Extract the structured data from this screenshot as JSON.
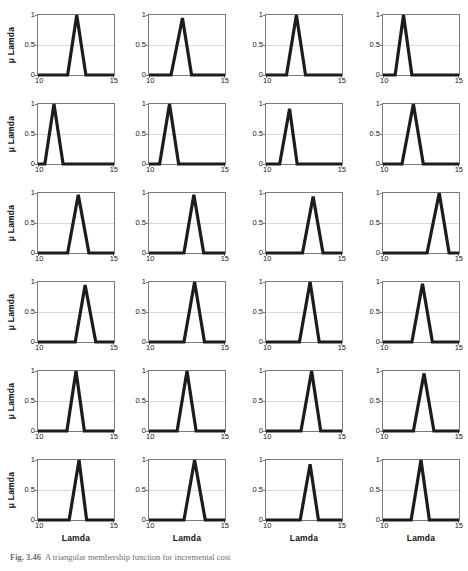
{
  "figure": {
    "caption_label": "Fig. 3.46",
    "caption_text": "A triangular membership function for incremental cost",
    "axis": {
      "xlabel": "Lamda",
      "ylabel": "μ Lamda",
      "xticks": [
        "10",
        "15"
      ],
      "yticks": [
        "1",
        "0.5",
        "0"
      ],
      "xlim": [
        10,
        15
      ],
      "ylim": [
        0,
        1
      ],
      "gridline_y": 0.5
    },
    "colors": {
      "curve": "#1c1c1c",
      "axis": "#7a7a7a",
      "gridline": "#d9d9d9",
      "background": "#ffffff",
      "caption": "#6f6f6f"
    },
    "rows": 6,
    "cols": 4
  },
  "chart_data": {
    "type": "line",
    "title": "A triangular membership function for incremental cost",
    "xlabel": "Lamda",
    "ylabel": "μ Lamda",
    "xlim": [
      10,
      15
    ],
    "ylim": [
      0,
      1
    ],
    "xticks": [
      10,
      15
    ],
    "yticks": [
      0,
      0.5,
      1
    ],
    "grid": "horizontal-midline-only",
    "legend": "none",
    "layout": {
      "rows": 6,
      "cols": 4,
      "shared_x": true,
      "shared_y": true
    },
    "panels": [
      {
        "index": 1,
        "row": 1,
        "col": 1,
        "peak_x": 12.55,
        "peak_y": 1.0,
        "left_x": 11.95,
        "right_x": 13.15,
        "x": [
          10,
          11.95,
          12.55,
          13.15,
          15
        ],
        "y": [
          0,
          0,
          1.0,
          0,
          0
        ]
      },
      {
        "index": 2,
        "row": 1,
        "col": 2,
        "peak_x": 12.2,
        "peak_y": 0.95,
        "left_x": 11.45,
        "right_x": 12.8,
        "x": [
          10,
          11.45,
          12.2,
          12.8,
          15
        ],
        "y": [
          0,
          0,
          0.95,
          0,
          0
        ]
      },
      {
        "index": 3,
        "row": 1,
        "col": 3,
        "peak_x": 12.0,
        "peak_y": 1.0,
        "left_x": 11.35,
        "right_x": 12.6,
        "x": [
          10,
          11.35,
          12.0,
          12.6,
          15
        ],
        "y": [
          0,
          0,
          1.0,
          0,
          0
        ]
      },
      {
        "index": 4,
        "row": 1,
        "col": 4,
        "peak_x": 11.35,
        "peak_y": 1.0,
        "left_x": 10.8,
        "right_x": 11.9,
        "x": [
          10,
          10.8,
          11.35,
          11.9,
          15
        ],
        "y": [
          0,
          0,
          1.0,
          0,
          0
        ]
      },
      {
        "index": 5,
        "row": 2,
        "col": 1,
        "peak_x": 11.05,
        "peak_y": 1.0,
        "left_x": 10.45,
        "right_x": 11.65,
        "x": [
          10,
          10.45,
          11.05,
          11.65,
          15
        ],
        "y": [
          0,
          0,
          1.0,
          0,
          0
        ]
      },
      {
        "index": 6,
        "row": 2,
        "col": 2,
        "peak_x": 11.35,
        "peak_y": 1.0,
        "left_x": 10.7,
        "right_x": 11.95,
        "x": [
          10,
          10.7,
          11.35,
          11.95,
          15
        ],
        "y": [
          0,
          0,
          1.0,
          0,
          0
        ]
      },
      {
        "index": 7,
        "row": 2,
        "col": 3,
        "peak_x": 11.55,
        "peak_y": 0.92,
        "left_x": 10.9,
        "right_x": 12.05,
        "x": [
          10,
          10.9,
          11.55,
          12.05,
          15
        ],
        "y": [
          0,
          0,
          0.92,
          0,
          0
        ]
      },
      {
        "index": 8,
        "row": 2,
        "col": 4,
        "peak_x": 12.0,
        "peak_y": 1.0,
        "left_x": 11.25,
        "right_x": 12.65,
        "x": [
          10,
          11.25,
          12.0,
          12.65,
          15
        ],
        "y": [
          0,
          0,
          1.0,
          0,
          0
        ]
      },
      {
        "index": 9,
        "row": 3,
        "col": 1,
        "peak_x": 12.65,
        "peak_y": 0.97,
        "left_x": 11.95,
        "right_x": 13.35,
        "x": [
          10,
          11.95,
          12.65,
          13.35,
          15
        ],
        "y": [
          0,
          0,
          0.97,
          0,
          0
        ]
      },
      {
        "index": 10,
        "row": 3,
        "col": 2,
        "peak_x": 12.95,
        "peak_y": 0.97,
        "left_x": 12.3,
        "right_x": 13.6,
        "x": [
          10,
          12.3,
          12.95,
          13.6,
          15
        ],
        "y": [
          0,
          0,
          0.97,
          0,
          0
        ]
      },
      {
        "index": 11,
        "row": 3,
        "col": 3,
        "peak_x": 13.1,
        "peak_y": 0.94,
        "left_x": 12.4,
        "right_x": 13.75,
        "x": [
          10,
          12.4,
          13.1,
          13.75,
          15
        ],
        "y": [
          0,
          0,
          0.94,
          0,
          0
        ]
      },
      {
        "index": 12,
        "row": 3,
        "col": 4,
        "peak_x": 13.7,
        "peak_y": 1.0,
        "left_x": 12.9,
        "right_x": 14.35,
        "x": [
          10,
          12.9,
          13.7,
          14.35,
          15
        ],
        "y": [
          0,
          0,
          1.0,
          0,
          0
        ]
      },
      {
        "index": 13,
        "row": 4,
        "col": 1,
        "peak_x": 13.1,
        "peak_y": 0.95,
        "left_x": 12.45,
        "right_x": 13.8,
        "x": [
          10,
          12.45,
          13.1,
          13.8,
          15
        ],
        "y": [
          0,
          0,
          0.95,
          0,
          0
        ]
      },
      {
        "index": 14,
        "row": 4,
        "col": 2,
        "peak_x": 13.0,
        "peak_y": 1.0,
        "left_x": 12.3,
        "right_x": 13.65,
        "x": [
          10,
          12.3,
          13.0,
          13.65,
          15
        ],
        "y": [
          0,
          0,
          1.0,
          0,
          0
        ]
      },
      {
        "index": 15,
        "row": 4,
        "col": 3,
        "peak_x": 12.9,
        "peak_y": 1.0,
        "left_x": 12.2,
        "right_x": 13.5,
        "x": [
          10,
          12.2,
          12.9,
          13.5,
          15
        ],
        "y": [
          0,
          0,
          1.0,
          0,
          0
        ]
      },
      {
        "index": 16,
        "row": 4,
        "col": 4,
        "peak_x": 12.6,
        "peak_y": 0.97,
        "left_x": 11.9,
        "right_x": 13.25,
        "x": [
          10,
          11.9,
          12.6,
          13.25,
          15
        ],
        "y": [
          0,
          0,
          0.97,
          0,
          0
        ]
      },
      {
        "index": 17,
        "row": 5,
        "col": 1,
        "peak_x": 12.5,
        "peak_y": 1.0,
        "left_x": 11.9,
        "right_x": 13.05,
        "x": [
          10,
          11.9,
          12.5,
          13.05,
          15
        ],
        "y": [
          0,
          0,
          1.0,
          0,
          0
        ]
      },
      {
        "index": 18,
        "row": 5,
        "col": 2,
        "peak_x": 12.5,
        "peak_y": 1.0,
        "left_x": 11.85,
        "right_x": 13.1,
        "x": [
          10,
          11.85,
          12.5,
          13.1,
          15
        ],
        "y": [
          0,
          0,
          1.0,
          0,
          0
        ]
      },
      {
        "index": 19,
        "row": 5,
        "col": 3,
        "peak_x": 13.0,
        "peak_y": 1.0,
        "left_x": 12.3,
        "right_x": 13.6,
        "x": [
          10,
          12.3,
          13.0,
          13.6,
          15
        ],
        "y": [
          0,
          0,
          1.0,
          0,
          0
        ]
      },
      {
        "index": 20,
        "row": 5,
        "col": 4,
        "peak_x": 12.7,
        "peak_y": 0.96,
        "left_x": 12.0,
        "right_x": 13.35,
        "x": [
          10,
          12.0,
          12.7,
          13.35,
          15
        ],
        "y": [
          0,
          0,
          0.96,
          0,
          0
        ]
      },
      {
        "index": 21,
        "row": 6,
        "col": 1,
        "peak_x": 12.7,
        "peak_y": 1.0,
        "left_x": 12.05,
        "right_x": 13.2,
        "x": [
          10,
          12.05,
          12.7,
          13.2,
          15
        ],
        "y": [
          0,
          0,
          1.0,
          0,
          0
        ]
      },
      {
        "index": 22,
        "row": 6,
        "col": 2,
        "peak_x": 13.0,
        "peak_y": 1.0,
        "left_x": 12.3,
        "right_x": 13.7,
        "x": [
          10,
          12.3,
          13.0,
          13.7,
          15
        ],
        "y": [
          0,
          0,
          1.0,
          0,
          0
        ]
      },
      {
        "index": 23,
        "row": 6,
        "col": 3,
        "peak_x": 12.9,
        "peak_y": 0.93,
        "left_x": 12.25,
        "right_x": 13.45,
        "x": [
          10,
          12.25,
          12.9,
          13.45,
          15
        ],
        "y": [
          0,
          0,
          0.93,
          0,
          0
        ]
      },
      {
        "index": 24,
        "row": 6,
        "col": 4,
        "peak_x": 12.5,
        "peak_y": 1.0,
        "left_x": 11.85,
        "right_x": 13.05,
        "x": [
          10,
          11.85,
          12.5,
          13.05,
          15
        ],
        "y": [
          0,
          0,
          1.0,
          0,
          0
        ]
      }
    ]
  }
}
